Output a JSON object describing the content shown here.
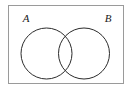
{
  "figure": {
    "name": "venn-diagram-two-sets",
    "type": "set-diagram",
    "colors": {
      "background": "#ffffff",
      "stroke": "#2b2b2b",
      "frame_stroke": "#9a9a9a",
      "label_color": "#1a1a1a"
    },
    "frame": {
      "name": "universal-set-rectangle",
      "x": 8,
      "y": 5,
      "width": 116,
      "height": 79,
      "stroke_width": 1
    },
    "circles": [
      {
        "label": "A",
        "name": "set-circle-a",
        "cx": 46.5,
        "cy": 53.5,
        "r": 25.5,
        "stroke_width": 1
      },
      {
        "label": "B",
        "name": "set-circle-b",
        "cx": 84,
        "cy": 53.5,
        "r": 25.5,
        "stroke_width": 1
      }
    ],
    "labels": [
      {
        "text": "A",
        "name": "label-set-a",
        "x": 26,
        "y": 22,
        "style": "italic"
      },
      {
        "text": "B",
        "name": "label-set-b",
        "x": 108,
        "y": 22,
        "style": "italic"
      }
    ]
  }
}
